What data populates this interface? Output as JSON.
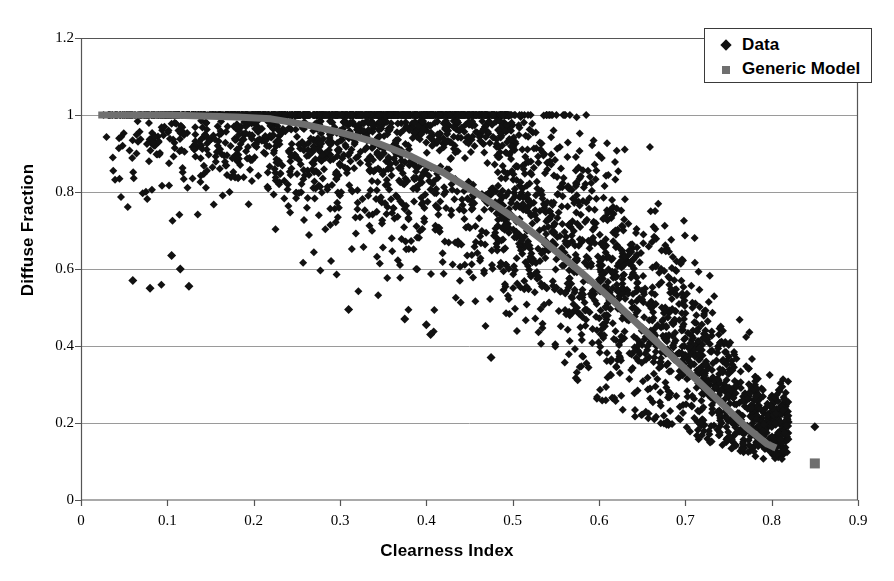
{
  "clipped_header": "A. Johnson et al. / Solar Energy",
  "chart_data": {
    "type": "scatter",
    "title": "",
    "xlabel": "Clearness Index",
    "ylabel": "Diffuse Fraction",
    "xlim": [
      0,
      0.9
    ],
    "ylim": [
      0,
      1.2
    ],
    "xticks": [
      0,
      0.1,
      0.2,
      0.3,
      0.4,
      0.5,
      0.6,
      0.7,
      0.8,
      0.9
    ],
    "xtick_labels": [
      "0",
      "0.1",
      "0.2",
      "0.3",
      "0.4",
      "0.5",
      "0.6",
      "0.7",
      "0.8",
      "0.9"
    ],
    "yticks": [
      0,
      0.2,
      0.4,
      0.6,
      0.8,
      1,
      1.2
    ],
    "ytick_labels": [
      "0",
      "0.2",
      "0.4",
      "0.6",
      "0.8",
      "1",
      "1.2"
    ],
    "grid": "horizontal",
    "legend_position": "top-right",
    "series": [
      {
        "name": "Data",
        "type": "scatter",
        "marker": "diamond",
        "color": "#111111",
        "marker_size": 8,
        "n_points": 2600,
        "x_range": [
          0.02,
          0.85
        ],
        "description": "Measured hourly diffuse fraction vs clearness index; dense saturated band at diffuse fraction 1.0 for clearness index below ~0.48, broad decreasing scatter thereafter converging near 0.15 at clearness index 0.80.",
        "band_envelope": [
          {
            "kt": 0.05,
            "lower": 0.55,
            "upper": 1.0,
            "center": 0.97
          },
          {
            "kt": 0.1,
            "lower": 0.55,
            "upper": 1.0,
            "center": 0.96
          },
          {
            "kt": 0.15,
            "lower": 0.72,
            "upper": 1.0,
            "center": 0.95
          },
          {
            "kt": 0.2,
            "lower": 0.7,
            "upper": 1.0,
            "center": 0.95
          },
          {
            "kt": 0.25,
            "lower": 0.62,
            "upper": 1.0,
            "center": 0.94
          },
          {
            "kt": 0.3,
            "lower": 0.5,
            "upper": 1.0,
            "center": 0.93
          },
          {
            "kt": 0.35,
            "lower": 0.45,
            "upper": 1.0,
            "center": 0.91
          },
          {
            "kt": 0.4,
            "lower": 0.42,
            "upper": 1.0,
            "center": 0.88
          },
          {
            "kt": 0.45,
            "lower": 0.4,
            "upper": 1.0,
            "center": 0.84
          },
          {
            "kt": 0.5,
            "lower": 0.37,
            "upper": 1.0,
            "center": 0.78
          },
          {
            "kt": 0.55,
            "lower": 0.32,
            "upper": 0.98,
            "center": 0.7
          },
          {
            "kt": 0.6,
            "lower": 0.28,
            "upper": 0.9,
            "center": 0.6
          },
          {
            "kt": 0.65,
            "lower": 0.24,
            "upper": 0.8,
            "center": 0.5
          },
          {
            "kt": 0.7,
            "lower": 0.2,
            "upper": 0.66,
            "center": 0.38
          },
          {
            "kt": 0.75,
            "lower": 0.16,
            "upper": 0.5,
            "center": 0.27
          },
          {
            "kt": 0.8,
            "lower": 0.13,
            "upper": 0.34,
            "center": 0.19
          }
        ],
        "outliers": [
          {
            "kt": 0.06,
            "df": 0.57
          },
          {
            "kt": 0.08,
            "df": 0.55
          },
          {
            "kt": 0.105,
            "df": 0.635
          },
          {
            "kt": 0.115,
            "df": 0.6
          },
          {
            "kt": 0.125,
            "df": 0.555
          },
          {
            "kt": 0.31,
            "df": 0.495
          },
          {
            "kt": 0.375,
            "df": 0.47
          },
          {
            "kt": 0.4,
            "df": 0.455
          },
          {
            "kt": 0.405,
            "df": 0.43
          },
          {
            "kt": 0.475,
            "df": 0.37
          },
          {
            "kt": 0.85,
            "df": 0.19
          }
        ]
      },
      {
        "name": "Generic Model",
        "type": "line",
        "marker": "square",
        "color": "#6f6f6f",
        "line_width": 7,
        "description": "Smooth generic correlation curve: flat at diffuse fraction 1.0 up to clearness index ~0.22, then decreasing monotonically to about 0.135 at clearness index 0.80.",
        "points": [
          {
            "kt": 0.02,
            "df": 1.0
          },
          {
            "kt": 0.1,
            "df": 1.0
          },
          {
            "kt": 0.18,
            "df": 0.995
          },
          {
            "kt": 0.22,
            "df": 0.99
          },
          {
            "kt": 0.26,
            "df": 0.975
          },
          {
            "kt": 0.3,
            "df": 0.955
          },
          {
            "kt": 0.34,
            "df": 0.93
          },
          {
            "kt": 0.38,
            "df": 0.895
          },
          {
            "kt": 0.42,
            "df": 0.85
          },
          {
            "kt": 0.46,
            "df": 0.795
          },
          {
            "kt": 0.5,
            "df": 0.735
          },
          {
            "kt": 0.54,
            "df": 0.665
          },
          {
            "kt": 0.58,
            "df": 0.59
          },
          {
            "kt": 0.62,
            "df": 0.51
          },
          {
            "kt": 0.66,
            "df": 0.425
          },
          {
            "kt": 0.7,
            "df": 0.34
          },
          {
            "kt": 0.74,
            "df": 0.255
          },
          {
            "kt": 0.77,
            "df": 0.19
          },
          {
            "kt": 0.795,
            "df": 0.145
          },
          {
            "kt": 0.805,
            "df": 0.135
          },
          {
            "kt": 0.85,
            "df": 0.095
          }
        ],
        "isolated_marker": {
          "kt": 0.85,
          "df": 0.095
        }
      }
    ]
  },
  "legend": {
    "items": [
      {
        "label": "Data",
        "marker": "diamond",
        "color": "#111111"
      },
      {
        "label": "Generic Model",
        "marker": "square",
        "color": "#6f6f6f"
      }
    ]
  },
  "colors": {
    "data_marker": "#111111",
    "model_line": "#6f6f6f",
    "axis": "#555555",
    "grid": "#9a9a9a",
    "background": "#ffffff"
  }
}
